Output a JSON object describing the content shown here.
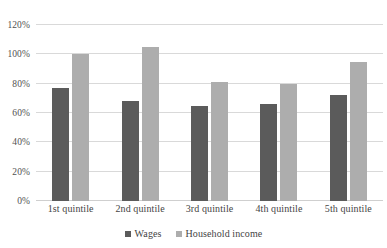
{
  "chart_data": {
    "type": "bar",
    "title": "",
    "subtitle": "",
    "xlabel": "",
    "ylabel": "",
    "categories": [
      "1st quintile",
      "2nd quintile",
      "3rd quintile",
      "4th quintile",
      "5th quintile"
    ],
    "series": [
      {
        "name": "Wages",
        "color": "#5b5b5b",
        "values": [
          77,
          68,
          65,
          66,
          72
        ]
      },
      {
        "name": "Household income",
        "color": "#adadad",
        "values": [
          100,
          105,
          81,
          80,
          95
        ]
      }
    ],
    "ylim": [
      0,
      120
    ],
    "ytick_values": [
      0,
      20,
      40,
      60,
      80,
      100,
      120
    ],
    "ytick_labels": [
      "0%",
      "20%",
      "40%",
      "60%",
      "80%",
      "100%",
      "120%"
    ],
    "grid": true,
    "legend_position": "bottom",
    "annotations": []
  },
  "legend": {
    "items": [
      {
        "label": "Wages",
        "swatch": "wages"
      },
      {
        "label": "Household income",
        "swatch": "household"
      }
    ]
  },
  "colors": {
    "wages": "#5b5b5b",
    "household_income": "#adadad",
    "gridline": "#d9d9d9",
    "axis_text": "#4a4a4a",
    "background": "#ffffff"
  }
}
